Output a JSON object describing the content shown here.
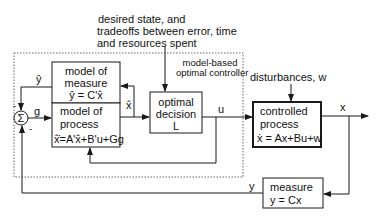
{
  "top_annotation": {
    "line1": "desired state, and",
    "line2": "tradeoffs between error, time",
    "line3": "and resources spent"
  },
  "controller_group": {
    "label_line1": "model-based",
    "label_line2": "optimal controller"
  },
  "model_of_measure": {
    "line1": "model of",
    "line2": "measure",
    "equation": "ŷ = C'x̂"
  },
  "model_of_process": {
    "line1": "model of",
    "line2": "process",
    "equation": "x̂̇=A'x̂+B'u+Gg"
  },
  "optimal_decision": {
    "line1": "optimal",
    "line2": "decision",
    "line3": "L"
  },
  "controlled_process": {
    "line1": "controlled",
    "line2": "process",
    "equation": "ẋ = Ax+Bu+w"
  },
  "measure": {
    "line1": "measure",
    "equation": "y = Cx"
  },
  "disturbances": {
    "label": "disturbances, w"
  },
  "summer": {
    "symbol": "Σ",
    "minus_top": "-",
    "minus_bottom": "-"
  },
  "signals": {
    "y_hat": "ŷ",
    "g": "g",
    "x_hat": "x̂",
    "u": "u",
    "x": "x",
    "y": "y"
  },
  "colors": {
    "line": "#1a1a1a",
    "dotted": "#666666",
    "background": "#ffffff"
  }
}
